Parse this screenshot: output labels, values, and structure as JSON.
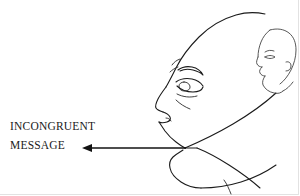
{
  "figure": {
    "kind": "line-art-illustration",
    "background_color": "#ffffff",
    "ink_color": "#1b1b1b"
  },
  "caption": {
    "line1": "INCONGRUENT",
    "line2": "MESSAGE",
    "color": "#1a1a1a"
  },
  "annotation": {
    "arrow": {
      "label": "arrow-pointing-left-from-mouth",
      "direction": "left",
      "from_x": 185,
      "from_y": 148,
      "to_x": 82,
      "to_y": 148,
      "color": "#121212"
    }
  },
  "subjects": [
    {
      "name": "foreground-head",
      "description": "Large human head drawn in profile facing right, with forehead, brow, eye, nose, lips, chin, jaw and neck",
      "orientation": "facing-right",
      "features": [
        "skull-crown",
        "forehead",
        "eyebrow",
        "eye",
        "nose",
        "nostril",
        "upper-lip",
        "lower-lip",
        "chin",
        "jawline",
        "neck"
      ]
    },
    {
      "name": "background-head",
      "description": "Smaller human head drawn in profile facing left, positioned behind and to the right of the foreground head",
      "orientation": "facing-left",
      "features": [
        "skull-crown",
        "brow",
        "eye",
        "nose",
        "lips",
        "chin",
        "jawline"
      ]
    }
  ]
}
